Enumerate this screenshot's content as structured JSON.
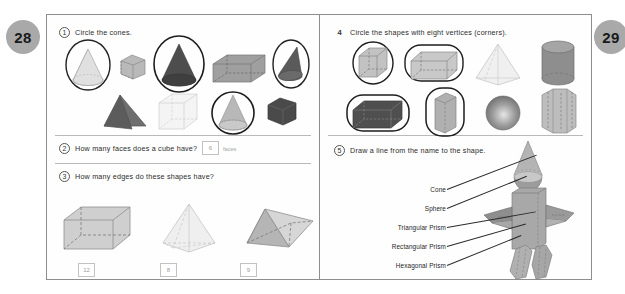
{
  "pages": {
    "left_number": "28",
    "right_number": "29"
  },
  "questions": {
    "q1": {
      "number": "1",
      "prompt": "Circle the cones."
    },
    "q2": {
      "number": "2",
      "prompt": "How many faces does a cube have?",
      "answer": "6",
      "unit": "faces"
    },
    "q3": {
      "number": "3",
      "prompt": "How many edges do these shapes have?",
      "answers": [
        "12",
        "8",
        "9"
      ]
    },
    "q4": {
      "number": "4",
      "prompt": "Circle the shapes with eight vertices (corners)."
    },
    "q5": {
      "number": "5",
      "prompt": "Draw a line from the name to the shape.",
      "labels": [
        "Cone",
        "Sphere",
        "Triangular Prism",
        "Rectangular Prism",
        "Hexagonal Prism"
      ]
    }
  },
  "q1_shapes": [
    {
      "name": "cone-light",
      "circled": true
    },
    {
      "name": "cube-gray-small",
      "circled": false
    },
    {
      "name": "cone-dark",
      "circled": true
    },
    {
      "name": "rectangular-prism-gray",
      "circled": false
    },
    {
      "name": "cone-dark-tilted",
      "circled": true
    },
    {
      "name": "pyramid-dark",
      "circled": false
    },
    {
      "name": "cube-white",
      "circled": false
    },
    {
      "name": "cone-gray",
      "circled": true
    },
    {
      "name": "cube-dark",
      "circled": false
    }
  ],
  "q3_shapes": [
    "rectangular-prism",
    "square-pyramid",
    "triangular-prism"
  ],
  "q4_shapes": [
    {
      "name": "cube",
      "circled": true
    },
    {
      "name": "rectangular-prism",
      "circled": true
    },
    {
      "name": "square-pyramid",
      "circled": false
    },
    {
      "name": "cylinder",
      "circled": false
    },
    {
      "name": "rectangular-prism-dark",
      "circled": true
    },
    {
      "name": "tall-prism",
      "circled": true
    },
    {
      "name": "sphere",
      "circled": false
    },
    {
      "name": "hexagonal-prism",
      "circled": false
    }
  ],
  "colors": {
    "badge": "#a9a9a9",
    "page_border": "#8e8e8e",
    "ink": "#2b2b2b",
    "shape_light": "#d2d2d2",
    "shape_mid": "#9a9a9a",
    "shape_dark": "#5a5a5a",
    "answer_text": "#9b9b9b"
  }
}
